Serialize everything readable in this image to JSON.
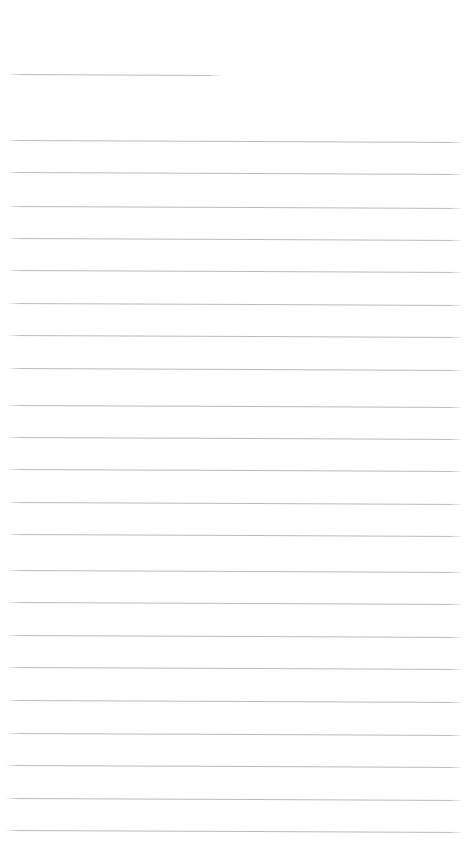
{
  "page": {
    "kind": "ruled-notebook-page",
    "width": 466,
    "height": 864,
    "background_color": "#ffffff",
    "content_text": "",
    "visible_text": []
  },
  "rules": {
    "color": "#b4b9bd",
    "thickness_px": 1,
    "skew_px": 2,
    "count_total": 23,
    "header_rule": {
      "label": "",
      "x": 8,
      "y": 74,
      "width": 214,
      "skew_px": 1
    },
    "body_rules": [
      {
        "x": 7,
        "y": 140,
        "width": 456
      },
      {
        "x": 7,
        "y": 172,
        "width": 456
      },
      {
        "x": 7,
        "y": 206,
        "width": 456
      },
      {
        "x": 7,
        "y": 238,
        "width": 456
      },
      {
        "x": 7,
        "y": 270,
        "width": 456
      },
      {
        "x": 7,
        "y": 303,
        "width": 456
      },
      {
        "x": 7,
        "y": 335,
        "width": 456
      },
      {
        "x": 7,
        "y": 368,
        "width": 456
      },
      {
        "x": 7,
        "y": 405,
        "width": 456
      },
      {
        "x": 7,
        "y": 437,
        "width": 456
      },
      {
        "x": 7,
        "y": 469,
        "width": 456
      },
      {
        "x": 7,
        "y": 502,
        "width": 456
      },
      {
        "x": 7,
        "y": 534,
        "width": 456
      },
      {
        "x": 6,
        "y": 570,
        "width": 457
      },
      {
        "x": 6,
        "y": 602,
        "width": 457
      },
      {
        "x": 6,
        "y": 635,
        "width": 457
      },
      {
        "x": 6,
        "y": 667,
        "width": 457
      },
      {
        "x": 6,
        "y": 700,
        "width": 457
      },
      {
        "x": 6,
        "y": 733,
        "width": 457
      },
      {
        "x": 5,
        "y": 765,
        "width": 458
      },
      {
        "x": 5,
        "y": 798,
        "width": 458
      },
      {
        "x": 5,
        "y": 830,
        "width": 458
      }
    ]
  }
}
